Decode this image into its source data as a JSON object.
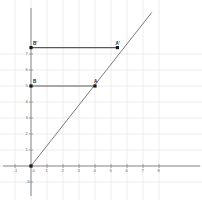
{
  "chart_data": {
    "type": "scatter",
    "title": "",
    "xlabel": "",
    "ylabel": "",
    "grid": true,
    "legend": false,
    "xlim": [
      -1.9,
      8.5
    ],
    "ylim": [
      -1.6,
      8.3
    ],
    "x_ticks": [
      "-1",
      "0",
      "1",
      "2",
      "3",
      "4",
      "5",
      "6",
      "7",
      "8"
    ],
    "x_tick_values": [
      -1,
      0,
      1,
      2,
      3,
      4,
      5,
      6,
      7,
      8
    ],
    "y_ticks": [
      "-1",
      "0",
      "1",
      "2",
      "3",
      "4",
      "5",
      "6",
      "7"
    ],
    "y_tick_values": [
      -1,
      0,
      1,
      2,
      3,
      4,
      5,
      6,
      7
    ],
    "points": [
      {
        "label": "B",
        "x": 0,
        "y": 5,
        "label_dx": 2,
        "label_dy": -6
      },
      {
        "label": "A",
        "x": 4,
        "y": 5,
        "label_dx": -1,
        "label_dy": -6
      },
      {
        "label": "B'",
        "x": 0,
        "y": 7.4,
        "label_dx": 2,
        "label_dy": -6
      },
      {
        "label": "A'",
        "x": 5.4,
        "y": 7.4,
        "label_dx": -2,
        "label_dy": -6
      },
      {
        "label": "",
        "x": 0,
        "y": 0,
        "label_dx": 0,
        "label_dy": 0
      }
    ],
    "segments": [
      {
        "name": "BA",
        "x1": 0,
        "y1": 5,
        "x2": 4,
        "y2": 5
      },
      {
        "name": "B'A'",
        "x1": 0,
        "y1": 7.4,
        "x2": 5.4,
        "y2": 7.4
      }
    ],
    "rays": [
      {
        "name": "dilation-ray",
        "x1": 0,
        "y1": 0,
        "x2": 7.55,
        "y2": 9.6
      }
    ],
    "colors": {
      "grid": "#e9e9e9",
      "axis": "#8a8a8a",
      "segment": "#5a5a5a",
      "ray": "#6a6a6a",
      "point": "#1a1a1a",
      "tick_text": "#666666",
      "background": "#ffffff"
    }
  }
}
